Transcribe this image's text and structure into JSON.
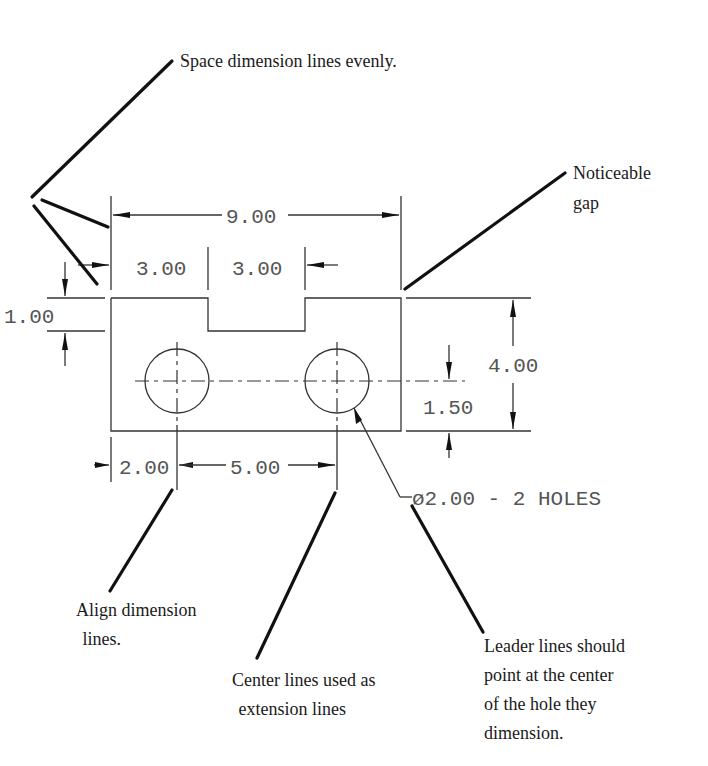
{
  "diagram": {
    "type": "engineering drawing dimensioning guidelines",
    "dimensions": {
      "overall_width": "9.00",
      "left_step_width": "3.00",
      "notch_width": "3.00",
      "notch_depth": "1.00",
      "overall_height": "4.00",
      "hole_height": "1.50",
      "hole_left_offset": "2.00",
      "hole_spacing": "5.00",
      "hole_callout": "ø2.00 - 2 HOLES"
    },
    "annotations": {
      "space_evenly": "Space dimension lines evenly.",
      "noticeable_gap_line1": "Noticeable",
      "noticeable_gap_line2": "gap",
      "align_line1": "Align dimension",
      "align_line2": " lines.",
      "center_line1": "Center lines used as",
      "center_line2": " extension lines",
      "leader_line1": "Leader lines should",
      "leader_line2": "point at the center",
      "leader_line3": "of the hole they",
      "leader_line4": "dimension."
    },
    "colors": {
      "annotation_text": "#1a1a1a",
      "dimension_text": "#555555",
      "line": "#333333",
      "background": "#ffffff"
    }
  }
}
